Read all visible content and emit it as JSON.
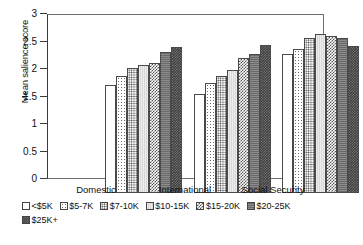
{
  "chart_data": {
    "type": "bar",
    "title": "",
    "xlabel": "",
    "ylabel": "Mean salience score",
    "ylim": [
      0,
      3
    ],
    "yticks": [
      "0",
      "0.5",
      "1",
      "1.5",
      "2",
      "2.5",
      "3"
    ],
    "ytick_values": [
      0,
      0.5,
      1,
      1.5,
      2,
      2.5,
      3
    ],
    "grid": false,
    "legend_position": "bottom",
    "categories": [
      "Domestic",
      "International",
      "Social Security"
    ],
    "series": [
      {
        "name": "<$5K",
        "values": [
          1.99,
          1.83,
          2.56
        ]
      },
      {
        "name": "$5-7K",
        "values": [
          2.15,
          2.02,
          2.65
        ]
      },
      {
        "name": "$7-10K",
        "values": [
          2.3,
          2.16,
          2.86
        ]
      },
      {
        "name": "$10-15K",
        "values": [
          2.35,
          2.26,
          2.92
        ]
      },
      {
        "name": "$15-20K",
        "values": [
          2.4,
          2.48,
          2.89
        ]
      },
      {
        "name": "$20-25K",
        "values": [
          2.6,
          2.55,
          2.86
        ]
      },
      {
        "name": "$25K+",
        "values": [
          2.68,
          2.72,
          2.71
        ]
      }
    ]
  },
  "colors": {
    "axis": "#3a3a3a",
    "frame": "#6e6e6e",
    "text": "#111111",
    "bar_outline": "#4a4a4a"
  }
}
